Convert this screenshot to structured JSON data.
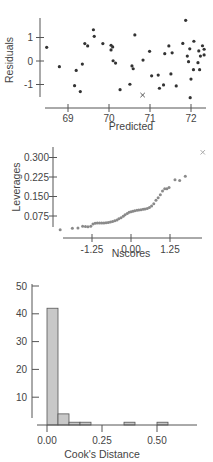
{
  "chart_data": [
    {
      "type": "scatter",
      "title": "",
      "xlabel": "Predicted",
      "ylabel": "Residuals",
      "xlim": [
        68.4,
        72.4
      ],
      "ylim": [
        -1.55,
        1.85
      ],
      "x_ticks": [
        69,
        70,
        71,
        72
      ],
      "x_tick_labels": [
        "69",
        "70",
        "71",
        "72"
      ],
      "y_ticks": [
        1,
        0,
        -1
      ],
      "y_tick_labels": [
        "1",
        "0",
        "-1"
      ],
      "grid": false,
      "legend": null,
      "marker_color": "#333333",
      "points": [
        [
          68.48,
          0.58
        ],
        [
          68.79,
          -0.24
        ],
        [
          69.16,
          -1.05
        ],
        [
          69.2,
          -0.4
        ],
        [
          69.3,
          -1.3
        ],
        [
          69.35,
          -0.13
        ],
        [
          69.41,
          0.74
        ],
        [
          69.48,
          0.64
        ],
        [
          69.62,
          1.33
        ],
        [
          69.64,
          1.05
        ],
        [
          69.85,
          0.74
        ],
        [
          70.05,
          0.67
        ],
        [
          70.09,
          0.6
        ],
        [
          70.05,
          0.47
        ],
        [
          70.1,
          0.01
        ],
        [
          70.16,
          -0.09
        ],
        [
          70.27,
          -1.22
        ],
        [
          70.51,
          -0.99
        ],
        [
          70.56,
          -0.21
        ],
        [
          70.59,
          -0.33
        ],
        [
          70.63,
          1.11
        ],
        [
          70.83,
          0.04
        ],
        [
          70.99,
          0.41
        ],
        [
          71.04,
          -0.63
        ],
        [
          71.2,
          -0.6
        ],
        [
          71.23,
          -1.16
        ],
        [
          71.33,
          -1.02
        ],
        [
          71.36,
          0.31
        ],
        [
          71.46,
          0.64
        ],
        [
          71.51,
          -0.55
        ],
        [
          71.54,
          0.35
        ],
        [
          71.64,
          -1.06
        ],
        [
          71.8,
          0.75
        ],
        [
          71.87,
          1.73
        ],
        [
          71.91,
          0.21
        ],
        [
          71.94,
          -0.03
        ],
        [
          71.97,
          0.52
        ],
        [
          72.0,
          -0.77
        ],
        [
          71.98,
          -1.56
        ],
        [
          72.06,
          -0.37
        ],
        [
          72.07,
          0.84
        ],
        [
          72.17,
          -0.07
        ],
        [
          72.19,
          0.43
        ],
        [
          72.21,
          -0.37
        ],
        [
          72.23,
          0.21
        ],
        [
          72.28,
          0.65
        ],
        [
          72.32,
          0.26
        ],
        [
          72.32,
          0.5
        ]
      ],
      "special_points": [
        {
          "x": 70.82,
          "y": -1.45,
          "marker": "x"
        }
      ]
    },
    {
      "type": "scatter",
      "title": "",
      "xlabel": "Nscores",
      "ylabel": "Leverages",
      "xlim": [
        -2.4,
        2.4
      ],
      "ylim": [
        0.0,
        0.33
      ],
      "x_ticks": [
        -1.25,
        0.0,
        1.25
      ],
      "x_tick_labels": [
        "-1.25",
        "0.00",
        "1.25"
      ],
      "y_ticks": [
        0.3,
        0.225,
        0.15,
        0.075
      ],
      "y_tick_labels": [
        "0.300",
        "0.225",
        "0.150",
        "0.075"
      ],
      "grid": false,
      "legend": null,
      "marker_color": "#8a8a8a",
      "points": [
        [
          -2.27,
          0.022
        ],
        [
          -1.88,
          0.028
        ],
        [
          -1.7,
          0.029
        ],
        [
          -1.55,
          0.036
        ],
        [
          -1.46,
          0.035
        ],
        [
          -1.38,
          0.034
        ],
        [
          -1.29,
          0.036
        ],
        [
          -1.22,
          0.044
        ],
        [
          -1.15,
          0.047
        ],
        [
          -1.08,
          0.048
        ],
        [
          -1.01,
          0.048
        ],
        [
          -0.94,
          0.048
        ],
        [
          -0.87,
          0.048
        ],
        [
          -0.8,
          0.049
        ],
        [
          -0.73,
          0.05
        ],
        [
          -0.66,
          0.052
        ],
        [
          -0.59,
          0.054
        ],
        [
          -0.52,
          0.057
        ],
        [
          -0.45,
          0.06
        ],
        [
          -0.39,
          0.064
        ],
        [
          -0.32,
          0.068
        ],
        [
          -0.25,
          0.074
        ],
        [
          -0.19,
          0.08
        ],
        [
          -0.12,
          0.085
        ],
        [
          -0.06,
          0.089
        ],
        [
          0.0,
          0.091
        ],
        [
          0.06,
          0.093
        ],
        [
          0.12,
          0.095
        ],
        [
          0.19,
          0.097
        ],
        [
          0.25,
          0.098
        ],
        [
          0.32,
          0.099
        ],
        [
          0.39,
          0.101
        ],
        [
          0.45,
          0.102
        ],
        [
          0.52,
          0.104
        ],
        [
          0.59,
          0.108
        ],
        [
          0.66,
          0.113
        ],
        [
          0.73,
          0.122
        ],
        [
          0.8,
          0.136
        ],
        [
          0.87,
          0.145
        ],
        [
          0.94,
          0.157
        ],
        [
          1.01,
          0.171
        ],
        [
          1.08,
          0.18
        ],
        [
          1.15,
          0.18
        ],
        [
          1.22,
          0.185
        ],
        [
          1.41,
          0.214
        ],
        [
          1.56,
          0.212
        ],
        [
          1.74,
          0.228
        ]
      ],
      "special_points": [
        {
          "x": 2.3,
          "y": 0.32,
          "marker": "x"
        }
      ]
    },
    {
      "type": "bar",
      "subtype": "histogram",
      "title": "",
      "xlabel": "Cook's Distance",
      "ylabel": "",
      "xlim": [
        -0.05,
        0.67
      ],
      "ylim": [
        0,
        52
      ],
      "x_ticks": [
        0.0,
        0.25,
        0.5
      ],
      "x_tick_labels": [
        "0.00",
        "0.25",
        "0.50"
      ],
      "y_ticks": [
        50,
        40,
        30,
        20,
        10
      ],
      "y_tick_labels": [
        "50",
        "40",
        "30",
        "20",
        "10"
      ],
      "grid": false,
      "legend": null,
      "bar_color": "#c8c8c8",
      "bin_width": 0.05,
      "categories": [
        "0.00-0.05",
        "0.05-0.10",
        "0.10-0.15",
        "0.15-0.20",
        "0.20-0.25",
        "0.25-0.30",
        "0.30-0.35",
        "0.35-0.40",
        "0.40-0.45",
        "0.45-0.50",
        "0.50-0.55"
      ],
      "bin_starts": [
        0.0,
        0.05,
        0.1,
        0.15,
        0.2,
        0.25,
        0.3,
        0.35,
        0.4,
        0.45,
        0.5
      ],
      "values": [
        42,
        4,
        1,
        1,
        0,
        0,
        0,
        1,
        0,
        0,
        1
      ]
    }
  ]
}
